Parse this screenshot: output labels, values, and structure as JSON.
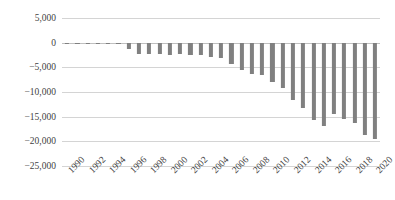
{
  "chart_data": {
    "type": "bar",
    "title": "",
    "subtitle": "",
    "xlabel": "",
    "ylabel": "",
    "grid": true,
    "legend": false,
    "orientation": "vertical",
    "bar_color": "#808080",
    "gridline_color": "#d4d4d4",
    "background": "#ffffff",
    "ylim": [
      -25000,
      5000
    ],
    "ytick_step": 5000,
    "ytick_labels": [
      "5,000",
      "0",
      "−5,000",
      "−10,000",
      "−15,000",
      "−20,000",
      "−25,000"
    ],
    "ytick_values": [
      5000,
      0,
      -5000,
      -10000,
      -15000,
      -20000,
      -25000
    ],
    "xtick_label_interval": 2,
    "xtick_label_rotation": -45,
    "categories": [
      "1990",
      "1991",
      "1992",
      "1993",
      "1994",
      "1995",
      "1996",
      "1997",
      "1998",
      "1999",
      "2000",
      "2001",
      "2002",
      "2003",
      "2004",
      "2005",
      "2006",
      "2007",
      "2008",
      "2009",
      "2010",
      "2011",
      "2012",
      "2013",
      "2014",
      "2015",
      "2016",
      "2017",
      "2018",
      "2019",
      "2020"
    ],
    "visible_xtick_labels": [
      "1990",
      "",
      "1992",
      "",
      "1994",
      "",
      "1996",
      "",
      "1998",
      "",
      "2000",
      "",
      "2002",
      "",
      "2004",
      "",
      "2006",
      "",
      "2008",
      "",
      "2010",
      "",
      "2012",
      "",
      "2014",
      "",
      "2016",
      "",
      "2018",
      "",
      "2020"
    ],
    "values": [
      -300,
      -250,
      -200,
      -150,
      -200,
      -300,
      -1300,
      -2200,
      -2400,
      -2300,
      -2500,
      -2400,
      -2600,
      -2500,
      -3000,
      -3100,
      -4300,
      -5600,
      -6400,
      -6500,
      -8000,
      -9200,
      -11600,
      -13300,
      -15600,
      -16800,
      -14500,
      -15400,
      -16200,
      -18800,
      -19500
    ]
  }
}
